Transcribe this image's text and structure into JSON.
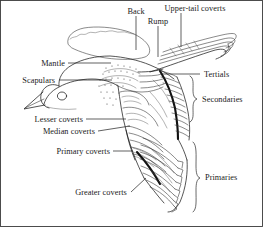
{
  "figure": {
    "background_color": "#ffffff",
    "ink_color": "#1d1d1d",
    "border": true,
    "width": 263,
    "height": 227
  },
  "labels": {
    "back": "Back",
    "rump": "Rump",
    "upper_tail_coverts": "Upper-tail coverts",
    "mantle": "Mantle",
    "scapulars": "Scapulars",
    "lesser_coverts": "Lesser coverts",
    "median_coverts": "Median coverts",
    "primary_coverts": "Primary coverts",
    "greater_coverts": "Greater coverts",
    "tertials": "Tertials",
    "secondaries": "Secondaries",
    "primaries": "Primaries"
  },
  "annotations": [
    {
      "id": "back",
      "text": "Back",
      "side": "top",
      "leader": "vertical-line",
      "x": 136,
      "y": 12
    },
    {
      "id": "rump",
      "text": "Rump",
      "side": "top",
      "leader": "vertical-line",
      "x": 158,
      "y": 22
    },
    {
      "id": "upper-tail-coverts",
      "text": "Upper-tail coverts",
      "side": "top",
      "leader": "vertical-line",
      "x": 181,
      "y": 9
    },
    {
      "id": "mantle",
      "text": "Mantle",
      "side": "left",
      "leader": "horizontal-line",
      "x": 48,
      "y": 63
    },
    {
      "id": "scapulars",
      "text": "Scapulars",
      "side": "left",
      "leader": "horizontal-line",
      "x": 55,
      "y": 80
    },
    {
      "id": "lesser-coverts",
      "text": "Lesser coverts",
      "side": "left",
      "leader": "horizontal-line",
      "x": 81,
      "y": 119
    },
    {
      "id": "median-coverts",
      "text": "Median coverts",
      "side": "left",
      "leader": "horizontal-line",
      "x": 92,
      "y": 131
    },
    {
      "id": "primary-coverts",
      "text": "Primary coverts",
      "side": "left",
      "leader": "horizontal-line",
      "x": 108,
      "y": 151
    },
    {
      "id": "greater-coverts",
      "text": "Greater coverts",
      "side": "bottom",
      "leader": "diagonal-line",
      "x": 104,
      "y": 195
    },
    {
      "id": "tertials",
      "text": "Tertials",
      "side": "right",
      "leader": "horizontal-line",
      "x": 206,
      "y": 74
    },
    {
      "id": "secondaries",
      "text": "Secondaries",
      "side": "right",
      "leader": "curly-brace",
      "x": 215,
      "y": 100
    },
    {
      "id": "primaries",
      "text": "Primaries",
      "side": "right",
      "leader": "curly-brace",
      "x": 216,
      "y": 176
    }
  ]
}
